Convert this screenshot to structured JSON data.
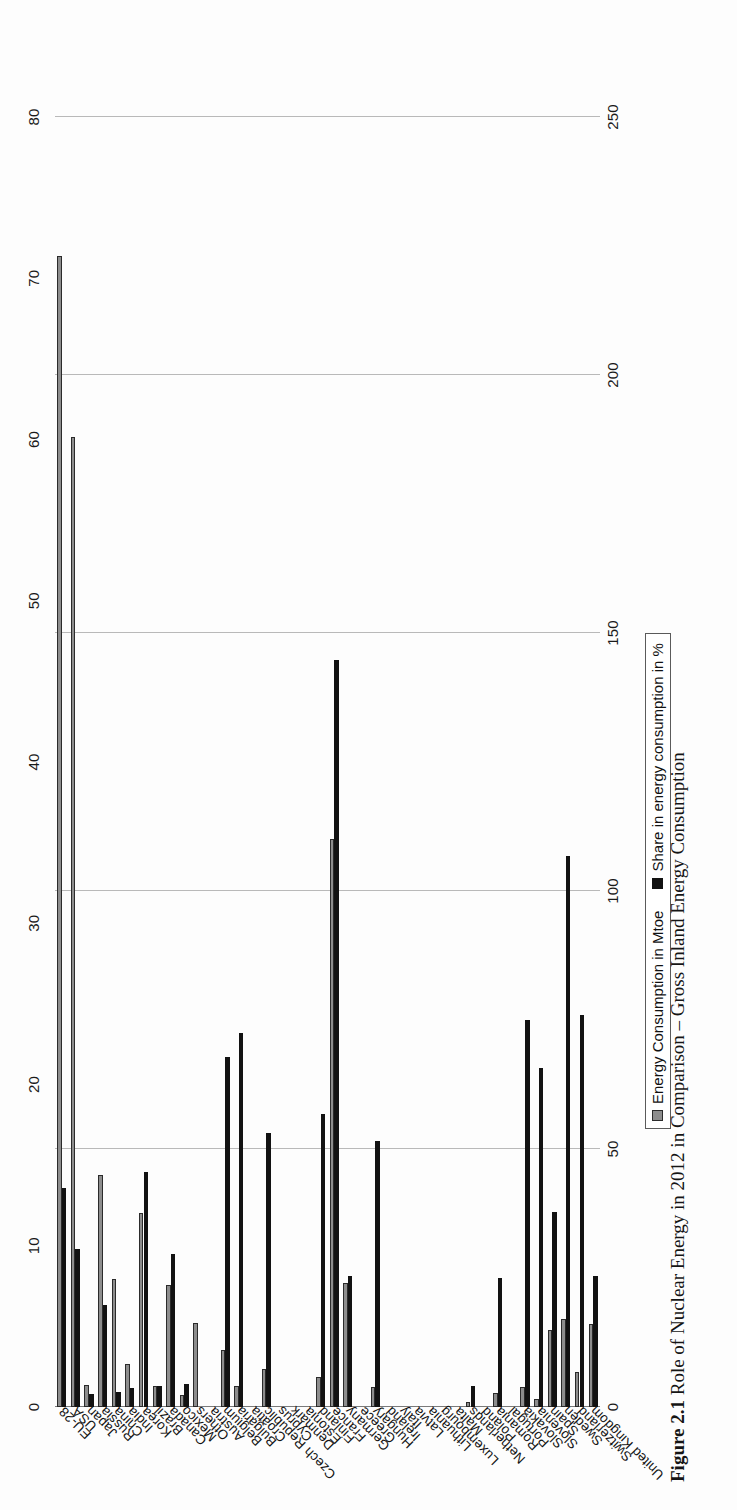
{
  "figure": {
    "caption_label": "Figure 2.1",
    "caption_text": "Role of Nuclear Energy in 2012 in Comparison – Gross Inland Energy Consumption"
  },
  "legend": {
    "position": "bottom-center",
    "items": [
      {
        "label": "Energy Consumption in Mtoe",
        "color": "#8d8d8d",
        "icon": "square-swatch"
      },
      {
        "label": "Share in energy consumption in %",
        "color": "#121212",
        "icon": "square-swatch"
      }
    ]
  },
  "axes": {
    "primary": {
      "name": "Energy Consumption in Mtoe",
      "ticks": [
        0,
        50,
        100,
        150,
        200,
        250
      ],
      "min": 0,
      "max": 250,
      "position": "bottom"
    },
    "secondary": {
      "name": "Share in energy consumption in %",
      "ticks": [
        0,
        10,
        20,
        30,
        40,
        50,
        60,
        70,
        80
      ],
      "min": 0,
      "max": 80,
      "position": "top"
    },
    "grid": true
  },
  "chart_data": {
    "type": "bar",
    "orientation": "horizontal",
    "title": "",
    "subtitle": "",
    "xlabel": "",
    "ylabel": "",
    "grid": true,
    "legend_position": "bottom-center",
    "xlim": [
      0,
      250
    ],
    "xlim_secondary": [
      0,
      80
    ],
    "categories": [
      "EU-28",
      "USA",
      "Japan",
      "Russia",
      "China",
      "India",
      "Korea",
      "Brazil",
      "Canada",
      "Mexico",
      "Others",
      "Austria",
      "Belgium",
      "Bulgaria",
      "Croatia",
      "Czech Republic",
      "Cyprus",
      "Denmark",
      "Estonia",
      "Finland",
      "France",
      "Germany",
      "Greece",
      "Hungary",
      "Ireland",
      "Italy",
      "Latvia",
      "Lithuania",
      "Luxembourg",
      "Malta",
      "Netherlands",
      "Poland",
      "Romania",
      "Portugal",
      "Slovakia",
      "Slovenia",
      "Spain",
      "Sweden",
      "Switzerland",
      "United Kingdom"
    ],
    "series": [
      {
        "name": "Energy Consumption in Mtoe",
        "axis": "primary",
        "color": "#8d8d8d",
        "values": [
          223.0,
          187.9,
          4.3,
          45.0,
          24.8,
          8.3,
          37.6,
          4.0,
          23.6,
          2.4,
          16.2,
          0.0,
          11.0,
          4.1,
          0.0,
          7.4,
          0.0,
          0.0,
          0.0,
          5.8,
          110.1,
          24.0,
          0.0,
          3.9,
          0.0,
          0.0,
          0.0,
          0.0,
          0.0,
          0.0,
          1.0,
          0.0,
          2.8,
          0.0,
          3.8,
          1.5,
          15.0,
          17.1,
          6.7,
          16.0
        ]
      },
      {
        "name": "Share in energy consumption in %",
        "axis": "secondary",
        "color": "#121212",
        "values": [
          13.6,
          9.8,
          0.8,
          6.3,
          0.9,
          1.2,
          14.6,
          1.3,
          9.5,
          1.4,
          0.0,
          0.0,
          21.7,
          23.2,
          0.0,
          17.0,
          0.0,
          0.0,
          0.0,
          18.2,
          46.3,
          8.1,
          0.0,
          16.5,
          0.0,
          0.0,
          0.0,
          0.0,
          0.0,
          0.0,
          1.3,
          0.0,
          8.0,
          0.0,
          24.0,
          21.0,
          12.1,
          34.2,
          24.3,
          8.1
        ]
      }
    ]
  }
}
